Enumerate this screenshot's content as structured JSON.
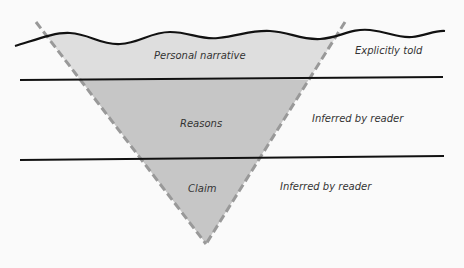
{
  "diagram": {
    "layers": [
      {
        "inside_label": "Personal narrative",
        "outside_label": "Explicitly told"
      },
      {
        "inside_label": "Reasons",
        "outside_label": "Inferred by reader"
      },
      {
        "inside_label": "Claim",
        "outside_label": "Inferred by reader"
      }
    ],
    "colors": {
      "top_fill": "#dedede",
      "lower_fill": "#c6c6c6",
      "dash": "#999999",
      "line": "#111111",
      "background": "#fafafa"
    }
  }
}
